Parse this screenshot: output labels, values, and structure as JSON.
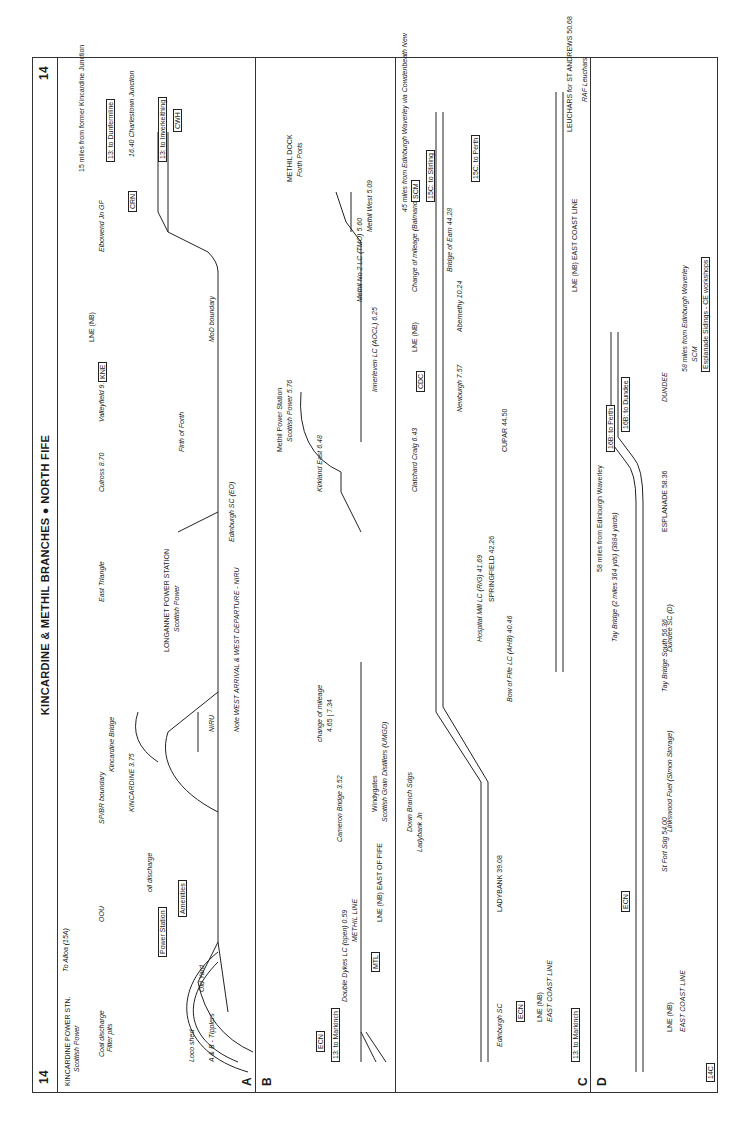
{
  "page": {
    "number": "14",
    "title": "KINCARDINE & METHIL BRANCHES ● NORTH FIFE"
  },
  "sections": {
    "A": {
      "label": "A",
      "route_start": "15 miles from former Kincardine Junction",
      "stations": [
        "KINCARDINE POWER STN.",
        "Scottish Power"
      ],
      "labels": [
        "To Alloa (15A)",
        "Coal discharge",
        "Filter pits",
        "Loco shed",
        "A & B - Tipplers",
        "Old Yard",
        "Power Station",
        "Amenities",
        "oil discharge",
        "OOU",
        "3.47",
        "3.35",
        "SP/BR boundary",
        "3.74",
        "3.73 LC",
        "KINCARDINE 3.75",
        "Kincardine Bridge",
        "4.06",
        "NIRU",
        "4.71",
        "West Triangle",
        "5.32 LC Longannet",
        "5.62",
        "LONGANNET POWER STATION",
        "Scottish Power",
        "East Triangle",
        "5.77",
        "Edinburgh SC (EO)",
        "Culross 8.70",
        "Valleyfield 9.60",
        "Firth of Forth",
        "KNE",
        "LNE (NB)",
        "DOWN →",
        "Crombie RNAD",
        "MoD boundary",
        "Charlestown Foundry LC (TMO)",
        "Brankside Jn 2.04",
        "Charlestown 2.15",
        "Elbowend Jn GF",
        "14.14",
        "0.00",
        "CRN",
        "15.38",
        "16.40 Charlestown Junction",
        "CWH"
      ],
      "note": "Note  WEST ARRIVAL & WEST DEPARTURE - NIRU",
      "mileposts": [
        "4",
        "5",
        "6",
        "7",
        "8",
        "9",
        "10",
        "11",
        "12",
        "13",
        "14"
      ],
      "boxes": [
        "13: to Dunfermline",
        "13: to Inverkeithing",
        "KNE",
        "CRN",
        "CWH"
      ]
    },
    "B": {
      "label": "B",
      "labels": [
        "Thornton North Jn",
        "0.11",
        "Double Dykes LC (open) 0.59",
        "METHIL LINE",
        "DOWN →",
        "MTL",
        "LNE (NB) EAST OF FIFE",
        "Cameron Bridge 3.52",
        "\"WINDYGATES\"",
        "Windygates",
        "Scottish Grain Distillers (UMGD)",
        "change of mileage",
        "4.65 | 7.34",
        "(East Fife Central Jn)",
        "Kirkland East 6.48",
        "6.40 Methil East",
        "Methil Power Station",
        "Scottish Power 5.76",
        "Loco shed",
        "NIRU",
        "Innerleven LC (AOCL) 6.25",
        "Methil No 2 LC (TMO) 5.60",
        "Methil West 5.09",
        "FP boundary",
        "METHIL DOCK",
        "Forth Ports"
      ],
      "mileposts": [
        "1",
        "2",
        "3",
        "4",
        "7",
        "6",
        "7"
      ],
      "boxes": [
        "ECN",
        "13: to Markinch",
        "13: to Kirkcaldy",
        "MTL"
      ]
    },
    "C": {
      "label": "C",
      "labels": [
        "Edinburgh SC",
        "ER | EB",
        "DOWN FIFE",
        "UP FIFE",
        "ECN",
        "LNE (NB)",
        "EAST COAST LINE",
        "38.75",
        "LADYBANK 39.08",
        "Station Sdgs",
        "CE workshops",
        "Ladybank Jn",
        "-0.03",
        "39.10",
        "Down Branch Sdgs",
        "DN BCH",
        "UP BCH",
        "DRS",
        "0.35",
        "CE Sidings GF 39.30",
        "39.44",
        "Up Sidings",
        "40",
        "Bow of Fife LC (AHB) 40.46",
        "Hospital Mill LC (R/G) 41.69",
        "SPRINGFIELD 42.26",
        "Edinburgh SC (EB)",
        "Cupar 58",
        "Clatchard Craig 6.43",
        "DOWN →",
        "Newburgh 7.57",
        "CDC",
        "LNE (NB)",
        "Abernethy 10.24",
        "Cupar 44.58",
        "44.65",
        "CUPAR 44.50",
        "Change of mileage (Balmano Jn.)",
        "14.10 | 44.18",
        "Bridge of Earn 44.28",
        "EB",
        "Edinburgh SC 45.28",
        "Earn Viaduct",
        "SCM",
        "15C: to Stirling",
        "48.17",
        "45.38",
        "Hilton Junction 45.66 · 14.923",
        "15C: to Perth",
        "45 miles from Edinburgh Waverley via Cowdenbeath New",
        "DOWN FIFE",
        "UP FIFE",
        "LNE (NB) EAST COAST LINE",
        "ECN",
        "LEUCHARS for ST ANDREWS 50.68",
        "50.79",
        "LC",
        "LC",
        "RAF Leuchars"
      ],
      "mileposts": [
        "34",
        "35",
        "36",
        "37",
        "38",
        "39",
        "41",
        "42",
        "43",
        "44",
        "45",
        "46",
        "47",
        "48",
        "49",
        "50",
        "51"
      ],
      "route_mileposts": [
        "1",
        "2",
        "3",
        "4",
        "5",
        "6",
        "7",
        "8",
        "9",
        "10",
        "11",
        "12",
        "13",
        "14"
      ],
      "boxes": [
        "13: to Markinch",
        "ECN",
        "CDC",
        "SCM",
        "15C: to Stirling",
        "15C: to Perth",
        "14D"
      ]
    },
    "D": {
      "label": "D",
      "labels": [
        "DOWN FIFE",
        "UP FIFE",
        "LNE (NB)",
        "EAST COAST LINE",
        "ECN",
        "St Fort Sdg 54.00",
        "Linkswood Fuel (Simon Storage)",
        "DRS",
        "56.38",
        "Tay Bridge South 56.36",
        "Dundee SC (D)",
        "Tay Bridge (2 miles 364 yds) (3884 yards)",
        "57.12",
        "57.58",
        "High Girders",
        "ESPLANADE 58.36",
        "58.56",
        "58.59",
        "58.69",
        "0.36 Dundee Central Jn",
        "SCM",
        "16B: to Perth",
        "16B: to Dundee",
        "Esplanade Sidings - CE workshops",
        "DUNDEE",
        "58 miles from Edinburgh Waverley"
      ],
      "mileposts": [
        "52",
        "53",
        "54",
        "55",
        "56",
        "57",
        "58"
      ],
      "boxes": [
        "14C",
        "ECN",
        "SCM",
        "16B: to Perth",
        "16B: to Dundee"
      ]
    }
  }
}
